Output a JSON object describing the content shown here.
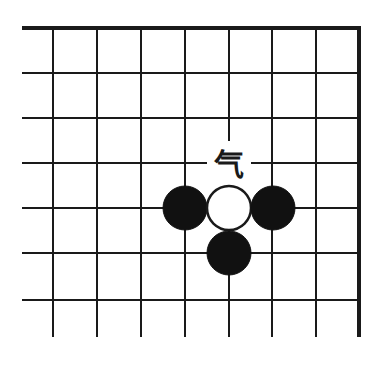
{
  "diagram": {
    "type": "go-board-fragment",
    "colors": {
      "background": "#ffffff",
      "line": "#1a1a1a",
      "black_stone": "#111111",
      "white_stone": "#ffffff"
    },
    "grid": {
      "vertical_x": [
        53,
        97,
        141,
        185,
        229,
        272,
        316
      ],
      "right_edge_x": 359,
      "top_edge_y": 28,
      "horizontal_y": [
        73,
        118,
        163,
        208,
        253,
        300
      ],
      "left_start_x": 22,
      "bottom_end_y": 337
    },
    "stones": [
      {
        "color": "black",
        "cx": 185,
        "cy": 208
      },
      {
        "color": "white",
        "cx": 229,
        "cy": 208
      },
      {
        "color": "black",
        "cx": 273,
        "cy": 208
      },
      {
        "color": "black",
        "cx": 229,
        "cy": 253
      }
    ],
    "stone_radius": 22,
    "annotation": {
      "text": "气",
      "meaning": "liberty",
      "x": 229,
      "y": 175
    }
  }
}
